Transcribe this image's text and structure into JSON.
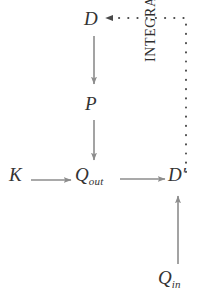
{
  "diagram": {
    "colors": {
      "background": "#ffffff",
      "arrow": "#8c8c8c",
      "dotted": "#4a4a4a",
      "text": "#333333"
    },
    "nodes": [
      {
        "id": "D",
        "label": "D",
        "subscript": "",
        "prime": ""
      },
      {
        "id": "P",
        "label": "P",
        "subscript": "",
        "prime": ""
      },
      {
        "id": "K",
        "label": "K",
        "subscript": "",
        "prime": ""
      },
      {
        "id": "Qout",
        "label": "Q",
        "subscript": "out",
        "prime": ""
      },
      {
        "id": "Dprime",
        "label": "D",
        "subscript": "",
        "prime": "′"
      },
      {
        "id": "Qin",
        "label": "Q",
        "subscript": "in",
        "prime": ""
      }
    ],
    "edges": [
      {
        "id": "d-to-p",
        "from": "D",
        "to": "P",
        "style": "solid",
        "direction": "down"
      },
      {
        "id": "p-to-qout",
        "from": "P",
        "to": "Qout",
        "style": "solid",
        "direction": "down"
      },
      {
        "id": "k-to-qout",
        "from": "K",
        "to": "Qout",
        "style": "solid",
        "direction": "right"
      },
      {
        "id": "qout-to-dprime",
        "from": "Qout",
        "to": "Dprime",
        "style": "solid",
        "direction": "right"
      },
      {
        "id": "qin-to-dprime",
        "from": "Qin",
        "to": "Dprime",
        "style": "solid",
        "direction": "up"
      },
      {
        "id": "dprime-to-d",
        "from": "Dprime",
        "to": "D",
        "style": "dotted",
        "direction": "up-left",
        "label": "INTEGRATION"
      }
    ],
    "annotations": {
      "integration_label": "INTEGRATION"
    }
  }
}
